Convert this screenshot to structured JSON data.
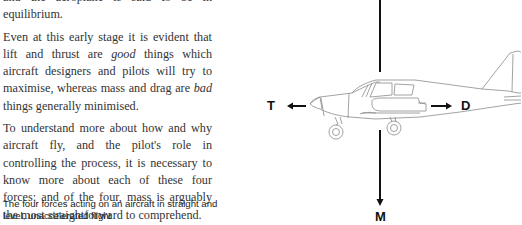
{
  "text": {
    "cut_line": "and the aeroplane is said to be in equilibrium.",
    "para1": {
      "part1": "Even at this early stage it is evident that lift and thrust are ",
      "emph1": "good",
      "part2": " things which aircraft designers and pilots will try to maximise, whereas mass and drag are ",
      "emph2": "bad",
      "part3": " things generally minimised."
    },
    "para2": "To understand more about how and why aircraft fly, and the pilot's role in controlling the process, it is necessary to know more about each of these four forces; and of the four, mass is arguably the most straightforward to comprehend."
  },
  "caption": "The four forces acting on an aircraft in straight and level, unaccelerated flight",
  "diagram": {
    "labels": {
      "thrust": "T",
      "drag": "D",
      "mass": "M"
    },
    "colors": {
      "arrow": "#111111",
      "aircraft_outline": "#8a8a8a"
    }
  }
}
